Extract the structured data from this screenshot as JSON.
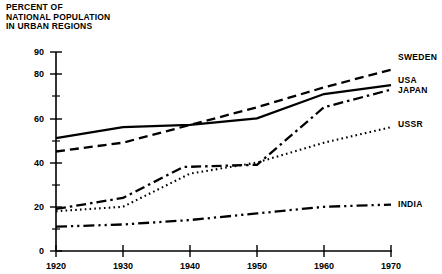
{
  "title_lines": "PERCENT OF\nNATIONAL POPULATION\nIN URBAN REGIONS",
  "axis": {
    "y_ticks_major": [
      "0",
      "20",
      "40",
      "60",
      "80",
      "90"
    ],
    "y_ticks_minor": [
      "10",
      "30",
      "50",
      "70"
    ],
    "x_ticks": [
      "1920",
      "1930",
      "1940",
      "1950",
      "1960",
      "1970"
    ]
  },
  "labels": {
    "sweden": "SWEDEN",
    "usa": "USA",
    "japan": "JAPAN",
    "ussr": "USSR",
    "india": "INDIA"
  },
  "colors": {
    "ink": "#000000",
    "background": "#ffffff"
  },
  "chart_data": {
    "type": "line",
    "title": "PERCENT OF NATIONAL POPULATION IN URBAN REGIONS",
    "xlabel": "",
    "ylabel": "PERCENT OF NATIONAL POPULATION IN URBAN REGIONS",
    "xlim": [
      1920,
      1970
    ],
    "ylim": [
      0,
      90
    ],
    "grid": false,
    "legend_position": "right-of-line-ends",
    "x": [
      1920,
      1930,
      1940,
      1950,
      1960,
      1970
    ],
    "series": [
      {
        "name": "SWEDEN",
        "linestyle": "dashed",
        "values": [
          45,
          49,
          57,
          65,
          74,
          82
        ],
        "points": [
          {
            "x": 1920,
            "y": 45
          },
          {
            "x": 1930,
            "y": 49
          },
          {
            "x": 1940,
            "y": 57
          },
          {
            "x": 1950,
            "y": 65
          },
          {
            "x": 1960,
            "y": 74
          },
          {
            "x": 1970,
            "y": 82
          }
        ]
      },
      {
        "name": "USA",
        "linestyle": "solid",
        "values": [
          51,
          56,
          57,
          60,
          71,
          75
        ],
        "points": [
          {
            "x": 1920,
            "y": 51
          },
          {
            "x": 1930,
            "y": 56
          },
          {
            "x": 1940,
            "y": 57
          },
          {
            "x": 1950,
            "y": 60
          },
          {
            "x": 1960,
            "y": 71
          },
          {
            "x": 1970,
            "y": 75
          }
        ]
      },
      {
        "name": "JAPAN",
        "linestyle": "dash-dot",
        "values": [
          19,
          24,
          38,
          39,
          65,
          73
        ],
        "points": [
          {
            "x": 1920,
            "y": 19
          },
          {
            "x": 1930,
            "y": 24
          },
          {
            "x": 1939,
            "y": 38
          },
          {
            "x": 1950,
            "y": 39
          },
          {
            "x": 1960,
            "y": 65
          },
          {
            "x": 1970,
            "y": 73
          }
        ]
      },
      {
        "name": "USSR",
        "linestyle": "dotted",
        "values": [
          18,
          20,
          35,
          40,
          49,
          56
        ],
        "points": [
          {
            "x": 1920,
            "y": 18
          },
          {
            "x": 1930,
            "y": 20
          },
          {
            "x": 1940,
            "y": 35
          },
          {
            "x": 1950,
            "y": 40
          },
          {
            "x": 1960,
            "y": 49
          },
          {
            "x": 1970,
            "y": 56
          }
        ]
      },
      {
        "name": "INDIA",
        "linestyle": "dash-dot-dot",
        "values": [
          11,
          12,
          14,
          17,
          20,
          21
        ],
        "points": [
          {
            "x": 1920,
            "y": 11
          },
          {
            "x": 1930,
            "y": 12
          },
          {
            "x": 1940,
            "y": 14
          },
          {
            "x": 1950,
            "y": 17
          },
          {
            "x": 1960,
            "y": 20
          },
          {
            "x": 1970,
            "y": 21
          }
        ]
      }
    ]
  }
}
